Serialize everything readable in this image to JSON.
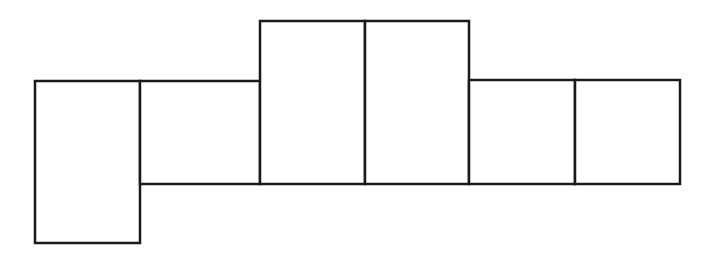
{
  "diagram": {
    "type": "rectangle-net",
    "width": 713,
    "height": 254,
    "stroke_color": "#1a1a1a",
    "background": "#ffffff",
    "rects": [
      {
        "id": "A",
        "x": 35,
        "y": 81,
        "w": 105,
        "h": 162
      },
      {
        "id": "B",
        "x": 140,
        "y": 81,
        "w": 120,
        "h": 103
      },
      {
        "id": "C",
        "x": 260,
        "y": 21,
        "w": 105,
        "h": 163
      },
      {
        "id": "D",
        "x": 365,
        "y": 21,
        "w": 104,
        "h": 163
      },
      {
        "id": "E",
        "x": 469,
        "y": 80,
        "w": 106,
        "h": 104
      },
      {
        "id": "F",
        "x": 575,
        "y": 80,
        "w": 105,
        "h": 104
      }
    ]
  }
}
